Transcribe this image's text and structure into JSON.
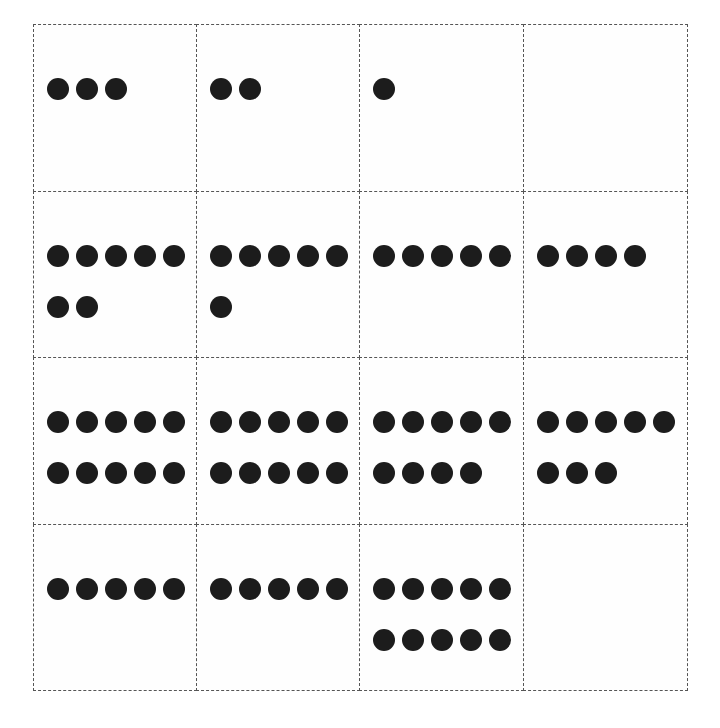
{
  "colors": {
    "dot": "#1c1c1c",
    "border": "#555555",
    "background": "#ffffff"
  },
  "grid": {
    "rows": 4,
    "columns": 4,
    "dots_per_row_max": 5,
    "cells": [
      {
        "row": 1,
        "col": 1,
        "count": 3
      },
      {
        "row": 1,
        "col": 2,
        "count": 2
      },
      {
        "row": 1,
        "col": 3,
        "count": 1
      },
      {
        "row": 1,
        "col": 4,
        "count": 0
      },
      {
        "row": 2,
        "col": 1,
        "count": 7
      },
      {
        "row": 2,
        "col": 2,
        "count": 6
      },
      {
        "row": 2,
        "col": 3,
        "count": 5
      },
      {
        "row": 2,
        "col": 4,
        "count": 4
      },
      {
        "row": 3,
        "col": 1,
        "count": 10
      },
      {
        "row": 3,
        "col": 2,
        "count": 10
      },
      {
        "row": 3,
        "col": 3,
        "count": 9
      },
      {
        "row": 3,
        "col": 4,
        "count": 8
      },
      {
        "row": 4,
        "col": 1,
        "count": 5
      },
      {
        "row": 4,
        "col": 2,
        "count": 5
      },
      {
        "row": 4,
        "col": 3,
        "count": 10
      },
      {
        "row": 4,
        "col": 4,
        "count": 0
      }
    ]
  }
}
